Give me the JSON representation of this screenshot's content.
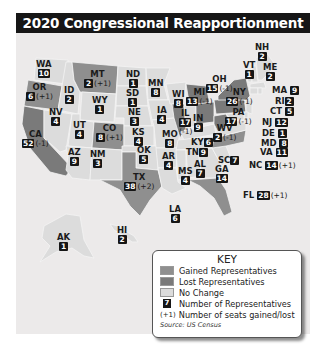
{
  "title": "2020 Congressional Reapportionment",
  "colors": {
    "gained": "#8f8f8f",
    "lost": "#7a7a7a",
    "no_change": "#dcdcdc",
    "background": "#eceaea",
    "title_bar": "#161616"
  },
  "states": [
    {
      "abbr": "WA",
      "reps": "10",
      "change": "",
      "status": "no_change"
    },
    {
      "abbr": "OR",
      "reps": "6",
      "change": "(+1)",
      "status": "gained"
    },
    {
      "abbr": "CA",
      "reps": "52",
      "change": "(-1)",
      "status": "lost"
    },
    {
      "abbr": "ID",
      "reps": "2",
      "change": "",
      "status": "no_change"
    },
    {
      "abbr": "NV",
      "reps": "4",
      "change": "",
      "status": "no_change"
    },
    {
      "abbr": "MT",
      "reps": "2",
      "change": "(+1)",
      "status": "gained"
    },
    {
      "abbr": "WY",
      "reps": "1",
      "change": "",
      "status": "no_change"
    },
    {
      "abbr": "UT",
      "reps": "4",
      "change": "",
      "status": "no_change"
    },
    {
      "abbr": "AZ",
      "reps": "9",
      "change": "",
      "status": "no_change"
    },
    {
      "abbr": "CO",
      "reps": "8",
      "change": "(+1)",
      "status": "gained"
    },
    {
      "abbr": "NM",
      "reps": "3",
      "change": "",
      "status": "no_change"
    },
    {
      "abbr": "ND",
      "reps": "1",
      "change": "",
      "status": "no_change"
    },
    {
      "abbr": "SD",
      "reps": "1",
      "change": "",
      "status": "no_change"
    },
    {
      "abbr": "NE",
      "reps": "3",
      "change": "",
      "status": "no_change"
    },
    {
      "abbr": "KS",
      "reps": "4",
      "change": "",
      "status": "no_change"
    },
    {
      "abbr": "OK",
      "reps": "5",
      "change": "",
      "status": "no_change"
    },
    {
      "abbr": "TX",
      "reps": "38",
      "change": "(+2)",
      "status": "gained"
    },
    {
      "abbr": "MN",
      "reps": "8",
      "change": "",
      "status": "no_change"
    },
    {
      "abbr": "IA",
      "reps": "4",
      "change": "",
      "status": "no_change"
    },
    {
      "abbr": "MO",
      "reps": "8",
      "change": "",
      "status": "no_change"
    },
    {
      "abbr": "AR",
      "reps": "4",
      "change": "",
      "status": "no_change"
    },
    {
      "abbr": "LA",
      "reps": "6",
      "change": "",
      "status": "no_change"
    },
    {
      "abbr": "WI",
      "reps": "8",
      "change": "",
      "status": "no_change"
    },
    {
      "abbr": "IL",
      "reps": "17",
      "change": "(-1)",
      "status": "lost"
    },
    {
      "abbr": "MI",
      "reps": "13",
      "change": "(-1)",
      "status": "lost"
    },
    {
      "abbr": "IN",
      "reps": "9",
      "change": "",
      "status": "no_change"
    },
    {
      "abbr": "OH",
      "reps": "15",
      "change": "(-1)",
      "status": "lost"
    },
    {
      "abbr": "KY",
      "reps": "6",
      "change": "",
      "status": "no_change"
    },
    {
      "abbr": "TN",
      "reps": "9",
      "change": "",
      "status": "no_change"
    },
    {
      "abbr": "MS",
      "reps": "4",
      "change": "",
      "status": "no_change"
    },
    {
      "abbr": "AL",
      "reps": "7",
      "change": "",
      "status": "no_change"
    },
    {
      "abbr": "GA",
      "reps": "14",
      "change": "",
      "status": "no_change"
    },
    {
      "abbr": "FL",
      "reps": "28",
      "change": "(+1)",
      "status": "gained"
    },
    {
      "abbr": "SC",
      "reps": "7",
      "change": "",
      "status": "no_change"
    },
    {
      "abbr": "NC",
      "reps": "14",
      "change": "(+1)",
      "status": "gained"
    },
    {
      "abbr": "VA",
      "reps": "11",
      "change": "",
      "status": "no_change"
    },
    {
      "abbr": "WV",
      "reps": "2",
      "change": "(-1)",
      "status": "lost"
    },
    {
      "abbr": "PA",
      "reps": "17",
      "change": "(-1)",
      "status": "lost"
    },
    {
      "abbr": "NY",
      "reps": "26",
      "change": "(-1)",
      "status": "lost"
    },
    {
      "abbr": "VT",
      "reps": "1",
      "change": "",
      "status": "no_change"
    },
    {
      "abbr": "NH",
      "reps": "2",
      "change": "",
      "status": "no_change"
    },
    {
      "abbr": "ME",
      "reps": "2",
      "change": "",
      "status": "no_change"
    },
    {
      "abbr": "MA",
      "reps": "9",
      "change": "",
      "status": "no_change"
    },
    {
      "abbr": "RI",
      "reps": "2",
      "change": "",
      "status": "no_change"
    },
    {
      "abbr": "CT",
      "reps": "5",
      "change": "",
      "status": "no_change"
    },
    {
      "abbr": "NJ",
      "reps": "12",
      "change": "",
      "status": "no_change"
    },
    {
      "abbr": "DE",
      "reps": "1",
      "change": "",
      "status": "no_change"
    },
    {
      "abbr": "MD",
      "reps": "8",
      "change": "",
      "status": "no_change"
    },
    {
      "abbr": "AK",
      "reps": "1",
      "change": "",
      "status": "no_change"
    },
    {
      "abbr": "HI",
      "reps": "2",
      "change": "",
      "status": "no_change"
    }
  ],
  "key": {
    "title": "KEY",
    "items": [
      {
        "label": "Gained Representatives",
        "swatch": "gained"
      },
      {
        "label": "Lost Representatives",
        "swatch": "lost"
      },
      {
        "label": "No Change",
        "swatch": "no_change"
      }
    ],
    "num_example": "7",
    "num_label": "Number of Representatives",
    "chg_example": "(+1)",
    "chg_label": "Number of seats gained/lost",
    "source": "Source: US Census"
  }
}
